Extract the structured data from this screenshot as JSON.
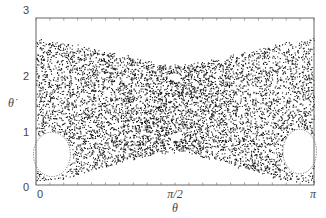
{
  "chart_data": {
    "type": "scatter",
    "title": "",
    "subtitle": "Poincaré section (phase portrait) — chaotic sea with regular islands",
    "xlabel": "θ",
    "ylabel": "θ̇",
    "xlim": [
      0,
      3.14159
    ],
    "ylim": [
      0,
      3
    ],
    "x_ticks": [
      {
        "value": 0,
        "label": "0"
      },
      {
        "value": 1.5708,
        "label": "π/2"
      },
      {
        "value": 3.14159,
        "label": "π"
      }
    ],
    "y_ticks": [
      {
        "value": 0,
        "label": "0"
      },
      {
        "value": 1,
        "label": "1"
      },
      {
        "value": 2,
        "label": "2"
      },
      {
        "value": 3,
        "label": "3"
      }
    ],
    "grid": false,
    "legend": null,
    "marker_color": "#1a1a1a",
    "series": [
      {
        "name": "chaotic sea",
        "description": "dense scatter of points bounded above and below",
        "upper_boundary": {
          "theta": [
            0,
            0.3,
            0.6,
            0.9,
            1.2,
            1.4,
            1.5708,
            1.8,
            2.1,
            2.4,
            2.7,
            3.0,
            3.14159
          ],
          "theta_dot": [
            2.62,
            2.56,
            2.47,
            2.36,
            2.25,
            2.18,
            2.15,
            2.18,
            2.28,
            2.4,
            2.52,
            2.6,
            2.65
          ]
        },
        "lower_boundary": {
          "theta": [
            0,
            0.3,
            0.6,
            0.9,
            1.2,
            1.4,
            1.5708,
            1.8,
            2.1,
            2.4,
            2.7,
            3.0,
            3.14159
          ],
          "theta_dot": [
            0.05,
            0.12,
            0.24,
            0.38,
            0.52,
            0.58,
            0.6,
            0.55,
            0.42,
            0.28,
            0.14,
            0.06,
            0.04
          ]
        }
      }
    ],
    "regular_islands": [
      {
        "name": "left island",
        "center_theta": 0.18,
        "center_theta_dot": 0.55,
        "half_width_theta": 0.22,
        "half_height_theta_dot": 0.42
      },
      {
        "name": "right island",
        "center_theta": 2.98,
        "center_theta_dot": 0.6,
        "half_width_theta": 0.2,
        "half_height_theta_dot": 0.42
      },
      {
        "name": "center lower island",
        "center_theta": 1.57,
        "center_theta_dot": 0.87,
        "half_width_theta": 0.07,
        "half_height_theta_dot": 0.06
      },
      {
        "name": "center upper gap",
        "center_theta": 1.56,
        "center_theta_dot": 1.95,
        "half_width_theta": 0.08,
        "half_height_theta_dot": 0.07
      }
    ],
    "point_count": 9000
  }
}
